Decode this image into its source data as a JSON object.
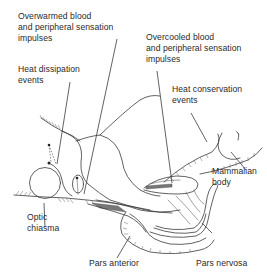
{
  "diagram": {
    "labels": {
      "overwarmed": [
        "Overwarmed blood",
        "and peripheral sensation",
        "impulses"
      ],
      "heat_dissipation": [
        "Heat dissipation",
        "events"
      ],
      "overcooled": [
        "Overcooled blood",
        "and peripheral sensation",
        "impulses"
      ],
      "heat_conservation": [
        "Heat conservation",
        "events"
      ],
      "mammalian_body": [
        "Mammalian",
        "body"
      ],
      "optic_chiasma": [
        "Optic",
        "chiasma"
      ],
      "pars_anterior": [
        "Pars anterior"
      ],
      "pars_nervosa": [
        "Pars nervosa"
      ]
    },
    "colors": {
      "line": "#3a3a3a",
      "text": "#2a2a2a",
      "background": "#ffffff"
    }
  }
}
